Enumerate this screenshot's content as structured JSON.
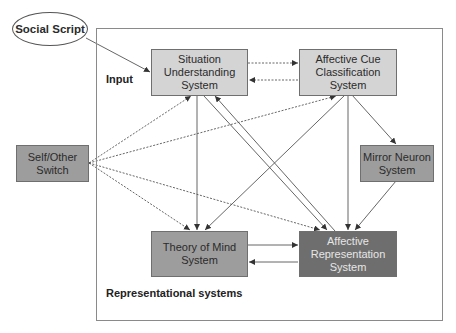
{
  "diagram": {
    "external_input": {
      "label": "Social Script"
    },
    "section_labels": {
      "input": "Input",
      "representational": "Representational systems"
    },
    "nodes": {
      "situation": {
        "label": "Situation\nUnderstanding\nSystem",
        "shade": "light"
      },
      "affective_cue": {
        "label": "Affective Cue\nClassification\nSystem",
        "shade": "light"
      },
      "self_other": {
        "label": "Self/Other\nSwitch",
        "shade": "mid"
      },
      "mirror": {
        "label": "Mirror Neuron\nSystem",
        "shade": "mid"
      },
      "theory_of_mind": {
        "label": "Theory of Mind\nSystem",
        "shade": "mid"
      },
      "affective_rep": {
        "label": "Affective\nRepresentation\nSystem",
        "shade": "dark"
      }
    },
    "edges": [
      {
        "from": "Social Script",
        "to": "Situation Understanding System",
        "style": "solid"
      },
      {
        "from": "Situation Understanding System",
        "to": "Affective Cue Classification System",
        "style": "dashed"
      },
      {
        "from": "Affective Cue Classification System",
        "to": "Situation Understanding System",
        "style": "dashed"
      },
      {
        "from": "Situation Understanding System",
        "to": "Theory of Mind System",
        "style": "solid",
        "bidirectional": true
      },
      {
        "from": "Situation Understanding System",
        "to": "Affective Representation System",
        "style": "solid"
      },
      {
        "from": "Affective Representation System",
        "to": "Situation Understanding System",
        "style": "solid"
      },
      {
        "from": "Affective Cue Classification System",
        "to": "Theory of Mind System",
        "style": "solid"
      },
      {
        "from": "Affective Cue Classification System",
        "to": "Affective Representation System",
        "style": "solid"
      },
      {
        "from": "Affective Cue Classification System",
        "to": "Mirror Neuron System",
        "style": "solid"
      },
      {
        "from": "Mirror Neuron System",
        "to": "Affective Representation System",
        "style": "solid"
      },
      {
        "from": "Self/Other Switch",
        "to": "Situation Understanding System",
        "style": "dashed"
      },
      {
        "from": "Self/Other Switch",
        "to": "Affective Cue Classification System",
        "style": "dashed"
      },
      {
        "from": "Self/Other Switch",
        "to": "Theory of Mind System",
        "style": "dashed"
      },
      {
        "from": "Self/Other Switch",
        "to": "Affective Representation System",
        "style": "dashed"
      },
      {
        "from": "Theory of Mind System",
        "to": "Affective Representation System",
        "style": "solid"
      },
      {
        "from": "Affective Representation System",
        "to": "Theory of Mind System",
        "style": "solid"
      }
    ],
    "colors": {
      "light": "#d4d4d4",
      "mid": "#9d9d9d",
      "dark": "#6e6e6e",
      "line": "#555555",
      "frame": "#8a8a8a"
    }
  }
}
